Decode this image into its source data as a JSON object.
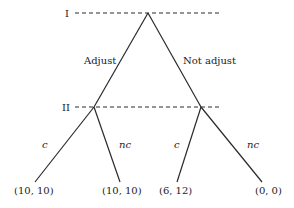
{
  "diagram": {
    "type": "game-tree",
    "players": {
      "p1": "I",
      "p2": "II"
    },
    "player1_actions": {
      "left": "Adjust",
      "right": "Not adjust"
    },
    "player2_actions": {
      "left_c": "c",
      "left_nc": "nc",
      "right_c": "c",
      "right_nc": "nc"
    },
    "payoffs": [
      "(10, 10)",
      "(10, 10)",
      "(6, 12)",
      "(0, 0)"
    ],
    "colors": {
      "line": "#2a2a2a",
      "text": "#222222",
      "background": "#ffffff"
    }
  }
}
